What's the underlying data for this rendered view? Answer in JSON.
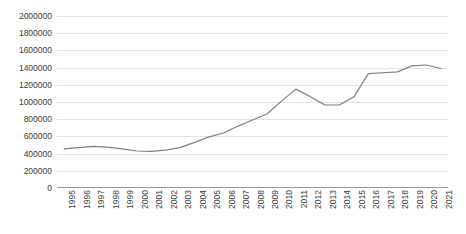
{
  "chart_data": {
    "type": "line",
    "title": "",
    "subtitle": "",
    "xlabel": "",
    "ylabel": "",
    "grid": true,
    "legend": false,
    "legend_position": "none",
    "line_color": "#808080",
    "gridline_color": "#E3E3E3",
    "axis_color": "#9A9A9A",
    "background_color": "#FFFFFF",
    "ylim": [
      0,
      2000000
    ],
    "ytick_values": [
      0,
      200000,
      400000,
      600000,
      800000,
      1000000,
      1200000,
      1400000,
      1600000,
      1800000,
      2000000
    ],
    "ytick_labels": [
      "0",
      "200000",
      "400000",
      "600000",
      "800000",
      "1000000",
      "1200000",
      "1400000",
      "1600000",
      "1800000",
      "2000000"
    ],
    "xtick_labels": [
      "1995",
      "1996",
      "1997",
      "1998",
      "1999",
      "2000",
      "2001",
      "2002",
      "2003",
      "2004",
      "2005",
      "2006",
      "2007",
      "2008",
      "2009",
      "2010",
      "2011",
      "2012",
      "2013",
      "2014",
      "2015",
      "2016",
      "2017",
      "2018",
      "2019",
      "2020",
      "2021"
    ],
    "categories": [
      "1995",
      "1996",
      "1997",
      "1998",
      "1999",
      "2000",
      "2001",
      "2002",
      "2003",
      "2004",
      "2005",
      "2006",
      "2007",
      "2008",
      "2009",
      "2010",
      "2011",
      "2012",
      "2013",
      "2014",
      "2015",
      "2016",
      "2017",
      "2018",
      "2019",
      "2020",
      "2021"
    ],
    "x": [
      1995,
      1996,
      1997,
      1998,
      1999,
      2000,
      2001,
      2002,
      2003,
      2004,
      2005,
      2006,
      2007,
      2008,
      2009,
      2010,
      2011,
      2012,
      2013,
      2014,
      2015,
      2016,
      2017,
      2018,
      2019,
      2020,
      2021
    ],
    "values": [
      455000,
      470000,
      485000,
      475000,
      455000,
      430000,
      425000,
      440000,
      470000,
      530000,
      595000,
      640000,
      720000,
      790000,
      860000,
      1010000,
      1150000,
      1060000,
      965000,
      965000,
      1060000,
      1330000,
      1340000,
      1350000,
      1420000,
      1430000,
      1390000
    ],
    "series": [
      {
        "name": "series-1",
        "color": "#808080",
        "values": [
          455000,
          470000,
          485000,
          475000,
          455000,
          430000,
          425000,
          440000,
          470000,
          530000,
          595000,
          640000,
          720000,
          790000,
          860000,
          1010000,
          1150000,
          1060000,
          965000,
          965000,
          1060000,
          1330000,
          1340000,
          1350000,
          1420000,
          1430000,
          1390000
        ]
      }
    ]
  }
}
